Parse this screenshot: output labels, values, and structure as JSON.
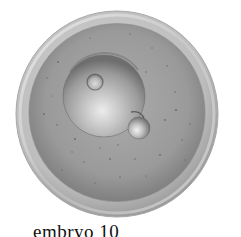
{
  "figure": {
    "caption": "embryo 10",
    "style": "grayscale stippled scientific illustration"
  },
  "illustration": {
    "outer_membrane": {
      "cx": 117,
      "cy": 114,
      "r": 102,
      "color_light": "#d2d2d2",
      "color_dark": "#9a9a9a"
    },
    "cytoplasm": {
      "cx": 117,
      "cy": 113,
      "r": 88,
      "color_light": "#a8a8a8",
      "color_dark": "#7e7e7e"
    },
    "nucleus": {
      "cx": 104,
      "cy": 96,
      "r": 41,
      "color_light": "#e4e4e4",
      "color_dark": "#7a7a7a"
    },
    "nucleolus": {
      "cx": 95,
      "cy": 82,
      "r": 8,
      "color_light": "#d8d8d8",
      "color_dark": "#6e6e6e"
    },
    "polar_body": {
      "cx": 139,
      "cy": 128,
      "r": 11,
      "color_light": "#ececec",
      "color_dark": "#7c7c7c"
    },
    "speckle_color": "#5e5e5e"
  }
}
